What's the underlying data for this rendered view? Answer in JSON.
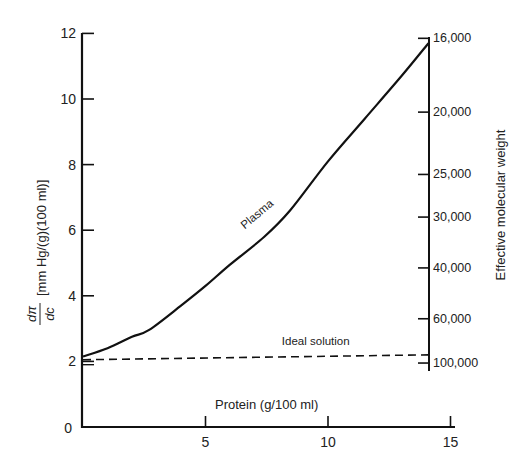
{
  "chart_data": {
    "type": "line",
    "title": "",
    "xlabel": "Protein (g/100 ml)",
    "ylabel": "dπ/dc [mm Hg/(g)(100 ml)]",
    "ylabel_fraction": {
      "numerator": "dπ",
      "denominator": "dc",
      "units": "[mm Hg/(g)(100 ml)]"
    },
    "y2label": "Effective molecular weight",
    "xlim": [
      0,
      15
    ],
    "ylim": [
      0,
      12
    ],
    "x_ticks": [
      5,
      10,
      15
    ],
    "x_tick_labels": [
      "5",
      "10",
      "15"
    ],
    "y_ticks": [
      0,
      2,
      4,
      6,
      8,
      10,
      12
    ],
    "y_tick_labels": [
      "0",
      "2",
      "4",
      "6",
      "8",
      "10",
      "12"
    ],
    "y2_ticks": [
      {
        "label": "16,000",
        "y": 11.85
      },
      {
        "label": "20,000",
        "y": 9.6
      },
      {
        "label": "25,000",
        "y": 7.7
      },
      {
        "label": "30,000",
        "y": 6.4
      },
      {
        "label": "40,000",
        "y": 4.85
      },
      {
        "label": "60,000",
        "y": 3.3
      },
      {
        "label": "100,000",
        "y": 1.95
      }
    ],
    "grid": false,
    "series": [
      {
        "name": "Plasma",
        "style": "solid",
        "x": [
          0,
          1,
          2,
          2.7,
          4,
          5,
          6,
          7.4,
          8.45,
          10,
          11.5,
          13,
          14.1
        ],
        "y": [
          2.15,
          2.4,
          2.75,
          2.96,
          3.7,
          4.3,
          4.95,
          5.8,
          6.6,
          8.1,
          9.4,
          10.7,
          11.7
        ]
      },
      {
        "name": "Ideal solution",
        "style": "dashed",
        "x": [
          0,
          14.1
        ],
        "y": [
          2.05,
          2.2
        ]
      }
    ],
    "annotations": [
      {
        "text": "Plasma",
        "x": 7.2,
        "y": 6.4,
        "rotation": -40
      },
      {
        "text": "Ideal solution",
        "x": 9.5,
        "y": 2.5
      }
    ]
  }
}
